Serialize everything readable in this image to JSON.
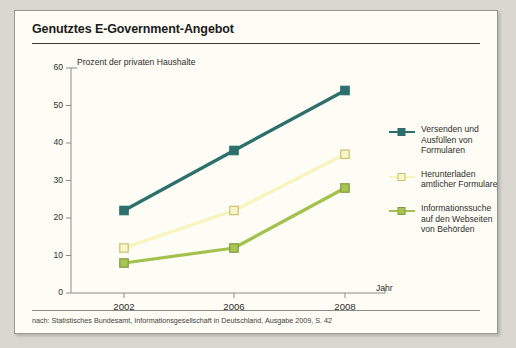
{
  "panel": {
    "title": "Genutztes E-Government-Angebot",
    "footer": "nach: Statistisches Bundesamt, Informationsgesellschaft in Deutschland, Ausgabe 2009, S. 42"
  },
  "chart_data": {
    "type": "line",
    "title": "Genutztes E-Government-Angebot",
    "xlabel": "Jahr",
    "ylabel": "Prozent der privaten Haushalte",
    "categories": [
      "2002",
      "2006",
      "2008"
    ],
    "ylim": [
      0,
      60
    ],
    "yticks": [
      "0",
      "10",
      "20",
      "30",
      "40",
      "50",
      "60"
    ],
    "grid": false,
    "legend_position": "right",
    "series": [
      {
        "name": "Versenden und Ausfüllen von Formularen",
        "values": [
          22,
          38,
          54
        ],
        "color": "#2c6f6c",
        "marker_fill": "#2c6f6c",
        "marker_stroke": "#2c6f6c"
      },
      {
        "name": "Herunterladen amtlicher Formulare",
        "values": [
          12,
          22,
          37
        ],
        "color": "#f7f4bd",
        "marker_fill": "#f9f6c9",
        "marker_stroke": "#cdbf72"
      },
      {
        "name": "Informationssuche auf den Webseiten von Behörden",
        "values": [
          8,
          12,
          28
        ],
        "color": "#a2c24b",
        "marker_fill": "#a8c653",
        "marker_stroke": "#7f9c37"
      }
    ]
  },
  "legend": {
    "entries": [
      {
        "line1": "Versenden und",
        "line2": "Ausfüllen von",
        "line3": "Formularen"
      },
      {
        "line1": "Herunterladen",
        "line2": "amtlicher Formulare",
        "line3": ""
      },
      {
        "line1": "Informationssuche",
        "line2": "auf den Webseiten",
        "line3": "von Behörden"
      }
    ]
  },
  "axes": {
    "y_caption": "Prozent der privaten Haushalte",
    "x_caption": "Jahr"
  }
}
